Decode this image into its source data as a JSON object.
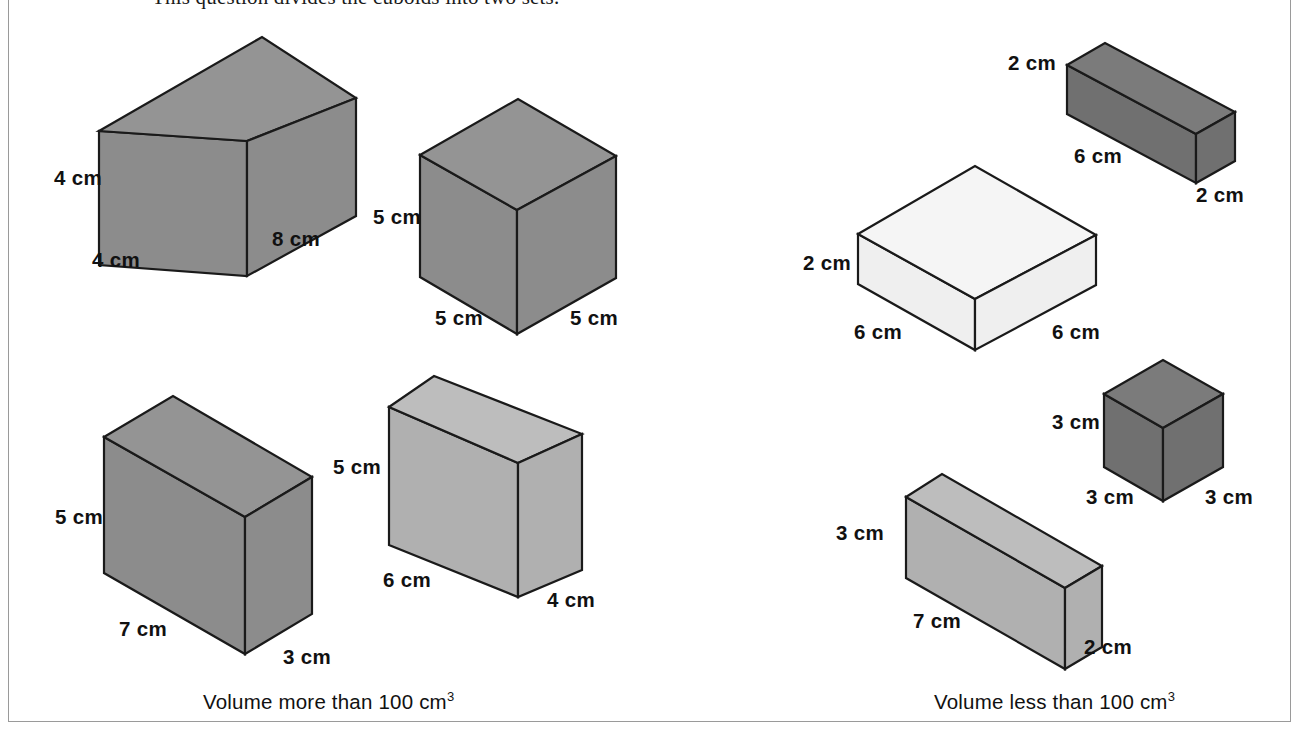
{
  "heading": "This question divides the cuboids into two sets.",
  "frame": {
    "border_color": "#9a9a9a"
  },
  "captions": {
    "left": "Volume more than 100 cm",
    "left_exponent": "3",
    "right": "Volume less than 100 cm",
    "right_exponent": "3"
  },
  "palette": {
    "outline": "#1a1a1a",
    "mid_gray": "#8c8c8c",
    "mid_gray_top": "#949494",
    "light_gray": "#b0b0b0",
    "light_gray_top": "#bdbdbd",
    "dark_gray": "#707070",
    "dark_gray_top": "#7b7b7b",
    "near_white": "#efefef",
    "near_white_top": "#f5f5f5",
    "background": "#ffffff"
  },
  "groups": [
    {
      "id": "volume-more-than-100",
      "caption": "Volume more than 100 cm3",
      "cuboids": [
        {
          "id": "cuboid-4x4x8",
          "name": "cuboid-4-by-4-by-8",
          "shade": "mid",
          "labels": [
            {
              "text": "4 cm",
              "role": "height",
              "x": 54,
              "y": 166
            },
            {
              "text": "4 cm",
              "role": "depth",
              "x": 92,
              "y": 248
            },
            {
              "text": "8 cm",
              "role": "width",
              "x": 272,
              "y": 227
            }
          ]
        },
        {
          "id": "cube-5x5x5",
          "name": "cube-5-by-5-by-5",
          "shade": "mid",
          "labels": [
            {
              "text": "5 cm",
              "role": "height",
              "x": 373,
              "y": 205
            },
            {
              "text": "5 cm",
              "role": "depth",
              "x": 435,
              "y": 306
            },
            {
              "text": "5 cm",
              "role": "width",
              "x": 570,
              "y": 306
            }
          ]
        },
        {
          "id": "cuboid-5x7x3",
          "name": "cuboid-5-by-7-by-3",
          "shade": "mid",
          "labels": [
            {
              "text": "5 cm",
              "role": "height",
              "x": 55,
              "y": 505
            },
            {
              "text": "7 cm",
              "role": "depth",
              "x": 119,
              "y": 617
            },
            {
              "text": "3 cm",
              "role": "width",
              "x": 283,
              "y": 645
            }
          ]
        },
        {
          "id": "cuboid-5x6x4",
          "name": "cuboid-5-by-6-by-4",
          "shade": "light",
          "labels": [
            {
              "text": "5 cm",
              "role": "height",
              "x": 333,
              "y": 455
            },
            {
              "text": "6 cm",
              "role": "depth",
              "x": 383,
              "y": 568
            },
            {
              "text": "4 cm",
              "role": "width",
              "x": 547,
              "y": 588
            }
          ]
        }
      ]
    },
    {
      "id": "volume-less-than-100",
      "caption": "Volume less than 100 cm3",
      "cuboids": [
        {
          "id": "cuboid-2x6x2",
          "name": "cuboid-2-by-6-by-2",
          "shade": "dark",
          "labels": [
            {
              "text": "2 cm",
              "role": "height",
              "x": 1008,
              "y": 51
            },
            {
              "text": "6 cm",
              "role": "depth",
              "x": 1074,
              "y": 144
            },
            {
              "text": "2 cm",
              "role": "width",
              "x": 1196,
              "y": 183
            }
          ]
        },
        {
          "id": "cuboid-2x6x6",
          "name": "cuboid-2-by-6-by-6",
          "shade": "white",
          "labels": [
            {
              "text": "2 cm",
              "role": "height",
              "x": 803,
              "y": 251
            },
            {
              "text": "6 cm",
              "role": "depth",
              "x": 854,
              "y": 320
            },
            {
              "text": "6 cm",
              "role": "width",
              "x": 1052,
              "y": 320
            }
          ]
        },
        {
          "id": "cube-3x3x3",
          "name": "cube-3-by-3-by-3",
          "shade": "dark",
          "labels": [
            {
              "text": "3 cm",
              "role": "height",
              "x": 1052,
              "y": 410
            },
            {
              "text": "3 cm",
              "role": "depth",
              "x": 1086,
              "y": 485
            },
            {
              "text": "3 cm",
              "role": "width",
              "x": 1205,
              "y": 485
            }
          ]
        },
        {
          "id": "cuboid-3x7x2",
          "name": "cuboid-3-by-7-by-2",
          "shade": "light",
          "labels": [
            {
              "text": "3 cm",
              "role": "height",
              "x": 836,
              "y": 521
            },
            {
              "text": "7 cm",
              "role": "depth",
              "x": 913,
              "y": 609
            },
            {
              "text": "2 cm",
              "role": "width",
              "x": 1084,
              "y": 635
            }
          ]
        }
      ]
    }
  ]
}
